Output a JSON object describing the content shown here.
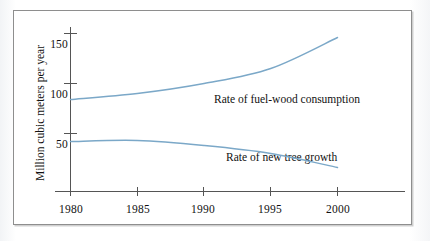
{
  "chart_data": {
    "type": "line",
    "title": "",
    "xlabel": "",
    "ylabel": "Million cubic meters per year",
    "xlim": [
      1979,
      2002
    ],
    "ylim": [
      0,
      160
    ],
    "grid": false,
    "legend_position": "inline-annotation",
    "x_ticks": [
      "1980",
      "1985",
      "1990",
      "1995",
      "2000"
    ],
    "x_tick_values": [
      1980,
      1985,
      1990,
      1995,
      2000
    ],
    "y_ticks": [
      "50",
      "100",
      "150"
    ],
    "y_tick_values": [
      50,
      100,
      150
    ],
    "x": [
      1980,
      1985,
      1990,
      1995,
      2000
    ],
    "series": [
      {
        "name": "Rate of fuel-wood consumption",
        "values": [
          84,
          90,
          100,
          115,
          146
        ],
        "color": "#7ba8c8"
      },
      {
        "name": "Rate of new tree growth",
        "values": [
          42,
          43,
          38,
          30,
          16
        ],
        "color": "#7ba8c8"
      }
    ],
    "annotations": [
      {
        "text": "Rate of fuel-wood consumption",
        "x": 1992.5,
        "y": 103
      },
      {
        "text": "Rate of new tree growth",
        "x": 1993.5,
        "y": 40
      }
    ]
  },
  "axis": {
    "y_title": "Million cubic meters per year",
    "y_tick_150": "150",
    "y_tick_100": "100",
    "y_tick_50": "50",
    "x_tick_1980": "1980",
    "x_tick_1985": "1985",
    "x_tick_1990": "1990",
    "x_tick_1995": "1995",
    "x_tick_2000": "2000"
  },
  "labels": {
    "fuelwood": "Rate of fuel-wood consumption",
    "treegrowth": "Rate of new tree growth"
  },
  "colors": {
    "curve": "#7ba8c8",
    "axis": "#555555",
    "frame": "#8e8e8e",
    "text": "#111111"
  }
}
